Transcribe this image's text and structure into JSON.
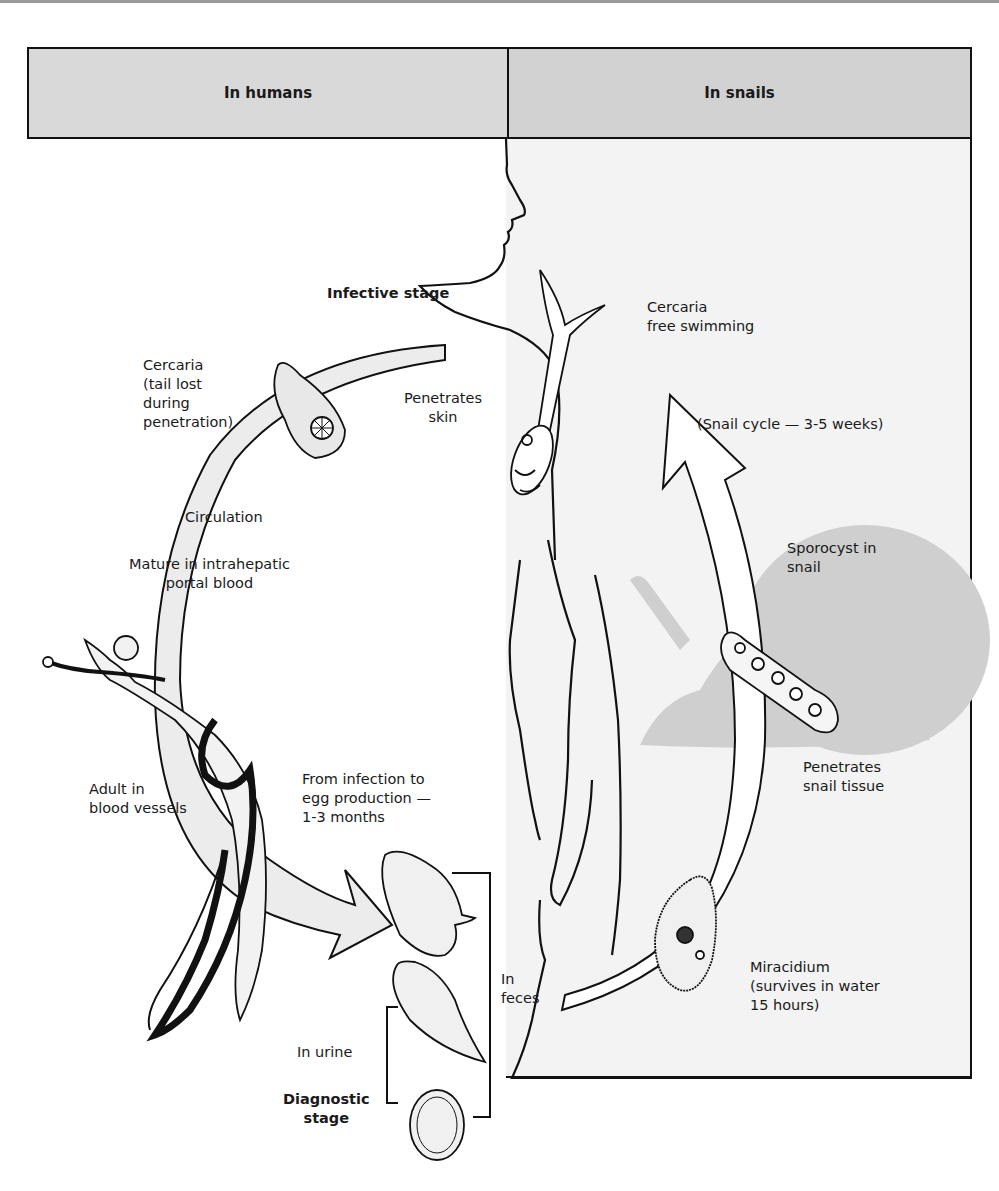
{
  "header": {
    "left_title": "In humans",
    "right_title": "In snails"
  },
  "labels": {
    "infective_stage": "Infective stage",
    "cercaria_free": "Cercaria\nfree swimming",
    "cercaria_tail_lost": "Cercaria\n(tail lost\nduring\npenetration)",
    "penetrates_skin": "Penetrates\nskin",
    "snail_cycle": "(Snail cycle — 3-5 weeks)",
    "circulation": "Circulation",
    "mature": "Mature in intrahepatic\nportal blood",
    "sporocyst": "Sporocyst in\nsnail",
    "adult": "Adult in\nblood vessels",
    "infection_to_egg": "From infection to\negg production —\n1-3 months",
    "penetrates_snail": "Penetrates\nsnail tissue",
    "in_feces": "In\nfeces",
    "in_urine": "In urine",
    "diagnostic_stage": "Diagnostic\nstage",
    "miracidium": "Miracidium\n(survives in water\n15 hours)"
  },
  "colors": {
    "header_fill": "#d9d9d9",
    "snail_panel": "#f3f3f3",
    "snail_silhouette": "#cfcfcf",
    "arrow_fill": "#ececec",
    "stroke": "#111111"
  }
}
